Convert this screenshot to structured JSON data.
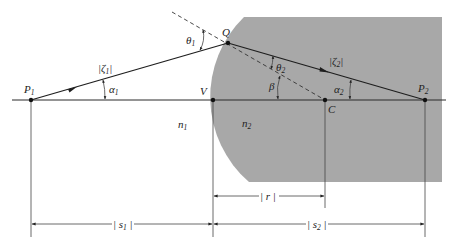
{
  "diagram": {
    "medium_color": "#a8a8a8",
    "points": [
      {
        "id": "P1",
        "label": "P",
        "sub": "1"
      },
      {
        "id": "Q",
        "label": "Q",
        "sub": ""
      },
      {
        "id": "V",
        "label": "V",
        "sub": ""
      },
      {
        "id": "C",
        "label": "C",
        "sub": ""
      },
      {
        "id": "P2",
        "label": "P",
        "sub": "2"
      }
    ],
    "media": [
      {
        "id": "n1",
        "label": "n",
        "sub": "1"
      },
      {
        "id": "n2",
        "label": "n",
        "sub": "2"
      }
    ],
    "angles": [
      {
        "id": "theta1",
        "label": "θ",
        "sub": "1"
      },
      {
        "id": "theta2",
        "label": "θ",
        "sub": "2"
      },
      {
        "id": "alpha1",
        "label": "α",
        "sub": "1"
      },
      {
        "id": "alpha2",
        "label": "α",
        "sub": "2"
      },
      {
        "id": "beta",
        "label": "β",
        "sub": ""
      }
    ],
    "path_lengths": [
      {
        "id": "zeta1",
        "label": "|ζ",
        "sub": "1",
        "close": "|"
      },
      {
        "id": "zeta2",
        "label": "|ζ",
        "sub": "2",
        "close": "|"
      }
    ],
    "dimensions": [
      {
        "id": "r",
        "label": "| r |"
      },
      {
        "id": "s1",
        "label": "| s",
        "sub": "1",
        "close": " |"
      },
      {
        "id": "s2",
        "label": "| s",
        "sub": "2",
        "close": " |"
      }
    ]
  }
}
